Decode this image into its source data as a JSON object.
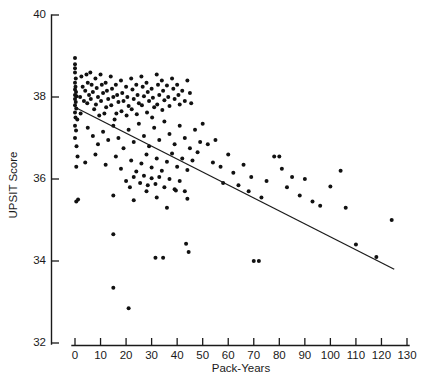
{
  "chart_data": {
    "type": "scatter",
    "title": "",
    "xlabel": "Pack-Years",
    "ylabel": "UPSIT Score",
    "xlim": [
      0,
      130
    ],
    "ylim": [
      32,
      40
    ],
    "xticks": [
      0,
      10,
      20,
      30,
      40,
      50,
      60,
      70,
      80,
      90,
      100,
      110,
      120,
      130
    ],
    "yticks": [
      32,
      34,
      36,
      38,
      40
    ],
    "grid": false,
    "legend": null,
    "marker": "filled-circle",
    "marker_color": "#111111",
    "trendline": {
      "type": "linear-regression",
      "color": "#1a1a1a",
      "x_start": 0,
      "y_start": 37.75,
      "x_end": 125,
      "y_end": 33.8
    },
    "points": [
      [
        0,
        38.95
      ],
      [
        0,
        38.8
      ],
      [
        0,
        38.7
      ],
      [
        0,
        38.6
      ],
      [
        0.3,
        38.45
      ],
      [
        0,
        38.35
      ],
      [
        0.2,
        38.25
      ],
      [
        0,
        38.18
      ],
      [
        0.4,
        38.12
      ],
      [
        0,
        38.05
      ],
      [
        0.6,
        38.02
      ],
      [
        0,
        37.95
      ],
      [
        0.3,
        37.88
      ],
      [
        0,
        37.8
      ],
      [
        0.5,
        37.72
      ],
      [
        0,
        37.62
      ],
      [
        0.2,
        37.5
      ],
      [
        0.9,
        37.45
      ],
      [
        0,
        37.3
      ],
      [
        0.4,
        37.18
      ],
      [
        0,
        37.0
      ],
      [
        0.6,
        36.8
      ],
      [
        1.0,
        36.55
      ],
      [
        0.5,
        36.3
      ],
      [
        1.2,
        35.5
      ],
      [
        2.5,
        38.5
      ],
      [
        3.0,
        38.25
      ],
      [
        2.0,
        38.0
      ],
      [
        3.5,
        37.9
      ],
      [
        2.2,
        37.6
      ],
      [
        4.5,
        38.55
      ],
      [
        5.0,
        38.35
      ],
      [
        4.0,
        38.15
      ],
      [
        5.5,
        38.05
      ],
      [
        4.8,
        37.85
      ],
      [
        6.0,
        38.6
      ],
      [
        6.5,
        38.3
      ],
      [
        7.0,
        38.12
      ],
      [
        6.2,
        37.95
      ],
      [
        7.5,
        37.7
      ],
      [
        8.0,
        38.45
      ],
      [
        8.5,
        38.22
      ],
      [
        9.0,
        38.0
      ],
      [
        8.2,
        37.82
      ],
      [
        9.5,
        37.55
      ],
      [
        10.0,
        38.55
      ],
      [
        10.5,
        38.3
      ],
      [
        11.0,
        38.1
      ],
      [
        10.2,
        37.9
      ],
      [
        11.5,
        37.6
      ],
      [
        12.0,
        38.35
      ],
      [
        12.5,
        38.15
      ],
      [
        13.0,
        37.95
      ],
      [
        12.2,
        37.75
      ],
      [
        14.0,
        38.5
      ],
      [
        14.5,
        38.2
      ],
      [
        15.0,
        38.0
      ],
      [
        14.2,
        37.8
      ],
      [
        15.5,
        37.45
      ],
      [
        16.0,
        38.3
      ],
      [
        16.5,
        38.05
      ],
      [
        17.0,
        37.88
      ],
      [
        16.2,
        37.6
      ],
      [
        18.0,
        38.4
      ],
      [
        18.5,
        38.1
      ],
      [
        19.0,
        37.9
      ],
      [
        18.2,
        37.65
      ],
      [
        20.0,
        38.25
      ],
      [
        20.5,
        38.0
      ],
      [
        21.0,
        37.78
      ],
      [
        20.2,
        37.55
      ],
      [
        22.0,
        38.45
      ],
      [
        22.5,
        38.18
      ],
      [
        23.0,
        37.95
      ],
      [
        22.2,
        37.7
      ],
      [
        24.0,
        38.3
      ],
      [
        24.5,
        38.05
      ],
      [
        25.0,
        37.85
      ],
      [
        24.2,
        37.58
      ],
      [
        26.0,
        38.5
      ],
      [
        26.5,
        38.25
      ],
      [
        27.0,
        38.02
      ],
      [
        26.2,
        37.8
      ],
      [
        28.0,
        38.35
      ],
      [
        28.5,
        38.12
      ],
      [
        29.0,
        37.9
      ],
      [
        28.2,
        37.62
      ],
      [
        30.0,
        38.2
      ],
      [
        30.5,
        37.98
      ],
      [
        31.0,
        37.75
      ],
      [
        30.2,
        37.5
      ],
      [
        32.0,
        38.55
      ],
      [
        32.5,
        38.3
      ],
      [
        33.0,
        38.05
      ],
      [
        32.2,
        37.82
      ],
      [
        34.0,
        38.4
      ],
      [
        34.5,
        38.15
      ],
      [
        35.0,
        37.92
      ],
      [
        34.2,
        37.68
      ],
      [
        36.0,
        38.28
      ],
      [
        36.5,
        38.0
      ],
      [
        37.0,
        37.78
      ],
      [
        38.0,
        38.45
      ],
      [
        38.5,
        38.2
      ],
      [
        39.0,
        37.95
      ],
      [
        40.0,
        38.3
      ],
      [
        40.5,
        38.05
      ],
      [
        41.0,
        37.82
      ],
      [
        42.0,
        38.15
      ],
      [
        43.0,
        37.9
      ],
      [
        44.0,
        38.4
      ],
      [
        45.0,
        38.1
      ],
      [
        45.5,
        37.85
      ],
      [
        5.0,
        37.25
      ],
      [
        7.0,
        37.05
      ],
      [
        9.0,
        36.85
      ],
      [
        11.0,
        37.15
      ],
      [
        13.0,
        36.95
      ],
      [
        15.0,
        37.3
      ],
      [
        17.0,
        37.0
      ],
      [
        19.0,
        36.75
      ],
      [
        21.0,
        37.2
      ],
      [
        23.0,
        36.9
      ],
      [
        25.0,
        37.35
      ],
      [
        27.0,
        37.05
      ],
      [
        29.0,
        36.8
      ],
      [
        31.0,
        37.25
      ],
      [
        33.0,
        36.95
      ],
      [
        35.0,
        37.4
      ],
      [
        37.0,
        37.1
      ],
      [
        39.0,
        36.85
      ],
      [
        41.0,
        37.3
      ],
      [
        43.0,
        37.0
      ],
      [
        45.0,
        36.75
      ],
      [
        47.0,
        37.2
      ],
      [
        49.0,
        36.9
      ],
      [
        4.0,
        36.4
      ],
      [
        8.0,
        36.6
      ],
      [
        12.0,
        36.35
      ],
      [
        16.0,
        36.55
      ],
      [
        18.0,
        36.25
      ],
      [
        22.0,
        36.45
      ],
      [
        24.0,
        36.18
      ],
      [
        26.0,
        36.38
      ],
      [
        28.0,
        36.6
      ],
      [
        30.0,
        36.28
      ],
      [
        32.0,
        36.5
      ],
      [
        34.0,
        36.2
      ],
      [
        36.0,
        36.42
      ],
      [
        38.0,
        36.62
      ],
      [
        40.0,
        36.3
      ],
      [
        42.0,
        36.5
      ],
      [
        44.0,
        36.22
      ],
      [
        46.0,
        36.45
      ],
      [
        48.0,
        36.65
      ],
      [
        20.0,
        35.95
      ],
      [
        21.5,
        35.8
      ],
      [
        23.0,
        36.05
      ],
      [
        25.5,
        35.9
      ],
      [
        27.0,
        36.08
      ],
      [
        28.5,
        35.85
      ],
      [
        30.0,
        36.02
      ],
      [
        31.5,
        35.88
      ],
      [
        33.0,
        36.05
      ],
      [
        35.0,
        35.8
      ],
      [
        37.0,
        36.0
      ],
      [
        39.0,
        35.75
      ],
      [
        41.0,
        35.95
      ],
      [
        43.0,
        35.7
      ],
      [
        0.5,
        35.45
      ],
      [
        15.0,
        35.6
      ],
      [
        23.0,
        35.48
      ],
      [
        28.0,
        35.7
      ],
      [
        32.0,
        35.55
      ],
      [
        36.0,
        35.3
      ],
      [
        39.5,
        35.72
      ],
      [
        44.0,
        35.52
      ],
      [
        15.0,
        34.65
      ],
      [
        31.5,
        34.08
      ],
      [
        34.5,
        34.08
      ],
      [
        43.5,
        34.42
      ],
      [
        44.5,
        34.22
      ],
      [
        15.0,
        33.35
      ],
      [
        21.0,
        32.85
      ],
      [
        50.0,
        37.35
      ],
      [
        52.0,
        36.85
      ],
      [
        54.0,
        36.4
      ],
      [
        55.0,
        36.95
      ],
      [
        57.0,
        36.3
      ],
      [
        58.0,
        35.9
      ],
      [
        60.0,
        36.6
      ],
      [
        62.0,
        36.15
      ],
      [
        64.0,
        35.85
      ],
      [
        66.0,
        36.35
      ],
      [
        68.0,
        35.7
      ],
      [
        69.0,
        36.05
      ],
      [
        70.0,
        34.0
      ],
      [
        72.0,
        34.0
      ],
      [
        73.0,
        35.55
      ],
      [
        75.0,
        35.95
      ],
      [
        78.0,
        36.55
      ],
      [
        80.0,
        36.55
      ],
      [
        81.0,
        36.25
      ],
      [
        83.0,
        35.8
      ],
      [
        85.0,
        36.05
      ],
      [
        88.0,
        35.6
      ],
      [
        90.0,
        36.0
      ],
      [
        93.0,
        35.45
      ],
      [
        96.0,
        35.35
      ],
      [
        100.0,
        35.82
      ],
      [
        104.0,
        36.2
      ],
      [
        106.0,
        35.3
      ],
      [
        110.0,
        34.4
      ],
      [
        118.0,
        34.1
      ],
      [
        124.0,
        35.0
      ]
    ]
  },
  "axes": {
    "x_axis_name": "pack-years-axis",
    "y_axis_name": "upsit-score-axis"
  }
}
